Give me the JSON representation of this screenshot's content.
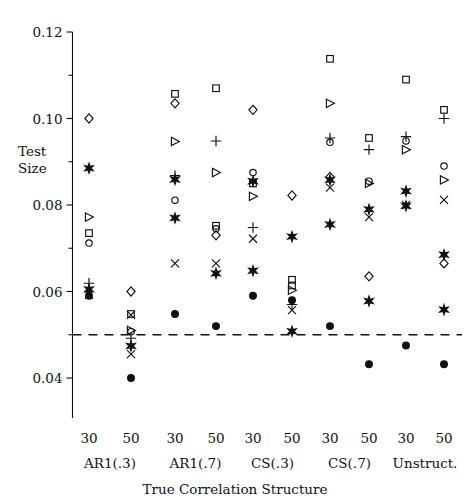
{
  "chart_data": {
    "type": "scatter",
    "title": "",
    "xlabel": "True Correlation Structure",
    "ylabel": "Test Size",
    "ylabel_line1": "Test",
    "ylabel_line2": "Size",
    "ylim": [
      0.028,
      0.12
    ],
    "yticks": [
      0.04,
      0.06,
      0.08,
      0.1,
      0.12
    ],
    "ytick_labels": [
      "0.04",
      "0.06",
      "0.08",
      "0.10",
      "0.12"
    ],
    "yminor_ticks": [
      0.05,
      0.07,
      0.09,
      0.11
    ],
    "grid": false,
    "legend": "none",
    "reference_line": {
      "y": 0.05,
      "style": "dashed",
      "label": "nominal 0.05 level"
    },
    "x_tick_labels": [
      "30",
      "50",
      "30",
      "50",
      "30",
      "50",
      "30",
      "50",
      "30",
      "50"
    ],
    "group_labels": [
      "AR1(.3)",
      "AR1(.7)",
      "CS(.3)",
      "CS(.7)",
      "Unstruct."
    ],
    "marker_types": [
      "circle",
      "square",
      "diamond",
      "triangle-right",
      "plus",
      "cross",
      "star",
      "filled-circle"
    ],
    "columns": [
      {
        "group": "AR1(.3)",
        "n": "30",
        "points": [
          {
            "marker": "diamond",
            "value": 0.1
          },
          {
            "marker": "star",
            "value": 0.0885
          },
          {
            "marker": "triangle-right",
            "value": 0.0772
          },
          {
            "marker": "square",
            "value": 0.0735
          },
          {
            "marker": "circle",
            "value": 0.0712
          },
          {
            "marker": "plus",
            "value": 0.0619
          },
          {
            "marker": "star",
            "value": 0.0605
          },
          {
            "marker": "cross",
            "value": 0.0592
          },
          {
            "marker": "filled-circle",
            "value": 0.059
          }
        ]
      },
      {
        "group": "AR1(.3)",
        "n": "50",
        "points": [
          {
            "marker": "diamond",
            "value": 0.06
          },
          {
            "marker": "square",
            "value": 0.0548
          },
          {
            "marker": "cross",
            "value": 0.0546
          },
          {
            "marker": "triangle-right",
            "value": 0.051
          },
          {
            "marker": "circle",
            "value": 0.0507
          },
          {
            "marker": "plus",
            "value": 0.0492
          },
          {
            "marker": "star",
            "value": 0.0474
          },
          {
            "marker": "cross",
            "value": 0.0455
          },
          {
            "marker": "filled-circle",
            "value": 0.04
          }
        ]
      },
      {
        "group": "AR1(.7)",
        "n": "30",
        "points": [
          {
            "marker": "square",
            "value": 0.1057
          },
          {
            "marker": "diamond",
            "value": 0.1035
          },
          {
            "marker": "triangle-right",
            "value": 0.0947
          },
          {
            "marker": "plus",
            "value": 0.0868
          },
          {
            "marker": "star",
            "value": 0.0859
          },
          {
            "marker": "circle",
            "value": 0.0811
          },
          {
            "marker": "star",
            "value": 0.077
          },
          {
            "marker": "cross",
            "value": 0.0665
          },
          {
            "marker": "filled-circle",
            "value": 0.0548
          }
        ]
      },
      {
        "group": "AR1(.7)",
        "n": "50",
        "points": [
          {
            "marker": "square",
            "value": 0.107
          },
          {
            "marker": "plus",
            "value": 0.0948
          },
          {
            "marker": "triangle-right",
            "value": 0.0875
          },
          {
            "marker": "square",
            "value": 0.0752
          },
          {
            "marker": "circle",
            "value": 0.0745
          },
          {
            "marker": "diamond",
            "value": 0.073
          },
          {
            "marker": "cross",
            "value": 0.0665
          },
          {
            "marker": "star",
            "value": 0.0642
          },
          {
            "marker": "filled-circle",
            "value": 0.052
          }
        ]
      },
      {
        "group": "CS(.3)",
        "n": "30",
        "points": [
          {
            "marker": "diamond",
            "value": 0.102
          },
          {
            "marker": "circle",
            "value": 0.0875
          },
          {
            "marker": "star",
            "value": 0.0855
          },
          {
            "marker": "square",
            "value": 0.085
          },
          {
            "marker": "triangle-right",
            "value": 0.082
          },
          {
            "marker": "plus",
            "value": 0.0748
          },
          {
            "marker": "cross",
            "value": 0.0722
          },
          {
            "marker": "star",
            "value": 0.0648
          },
          {
            "marker": "filled-circle",
            "value": 0.059
          }
        ]
      },
      {
        "group": "CS(.3)",
        "n": "50",
        "points": [
          {
            "marker": "diamond",
            "value": 0.0822
          },
          {
            "marker": "star",
            "value": 0.0727
          },
          {
            "marker": "square",
            "value": 0.0627
          },
          {
            "marker": "square",
            "value": 0.0614
          },
          {
            "marker": "triangle-right",
            "value": 0.0603
          },
          {
            "marker": "filled-circle",
            "value": 0.058
          },
          {
            "marker": "plus",
            "value": 0.057
          },
          {
            "marker": "cross",
            "value": 0.0557
          },
          {
            "marker": "star",
            "value": 0.0508
          }
        ]
      },
      {
        "group": "CS(.7)",
        "n": "30",
        "points": [
          {
            "marker": "square",
            "value": 0.1138
          },
          {
            "marker": "triangle-right",
            "value": 0.1035
          },
          {
            "marker": "plus",
            "value": 0.0955
          },
          {
            "marker": "circle",
            "value": 0.0945
          },
          {
            "marker": "diamond",
            "value": 0.0865
          },
          {
            "marker": "star",
            "value": 0.0858
          },
          {
            "marker": "cross",
            "value": 0.084
          },
          {
            "marker": "star",
            "value": 0.0755
          },
          {
            "marker": "filled-circle",
            "value": 0.052
          }
        ]
      },
      {
        "group": "CS(.7)",
        "n": "50",
        "points": [
          {
            "marker": "square",
            "value": 0.0955
          },
          {
            "marker": "plus",
            "value": 0.0928
          },
          {
            "marker": "circle",
            "value": 0.0855
          },
          {
            "marker": "triangle-right",
            "value": 0.085
          },
          {
            "marker": "star",
            "value": 0.079
          },
          {
            "marker": "cross",
            "value": 0.0772
          },
          {
            "marker": "diamond",
            "value": 0.0635
          },
          {
            "marker": "star",
            "value": 0.0578
          },
          {
            "marker": "filled-circle",
            "value": 0.0432
          }
        ]
      },
      {
        "group": "Unstruct.",
        "n": "30",
        "points": [
          {
            "marker": "square",
            "value": 0.109
          },
          {
            "marker": "plus",
            "value": 0.0958
          },
          {
            "marker": "circle",
            "value": 0.0948
          },
          {
            "marker": "triangle-right",
            "value": 0.0928
          },
          {
            "marker": "star",
            "value": 0.0832
          },
          {
            "marker": "cross",
            "value": 0.08
          },
          {
            "marker": "star",
            "value": 0.0798
          },
          {
            "marker": "filled-circle",
            "value": 0.0475
          }
        ]
      },
      {
        "group": "Unstruct.",
        "n": "50",
        "points": [
          {
            "marker": "square",
            "value": 0.102
          },
          {
            "marker": "plus",
            "value": 0.1
          },
          {
            "marker": "circle",
            "value": 0.089
          },
          {
            "marker": "triangle-right",
            "value": 0.0858
          },
          {
            "marker": "cross",
            "value": 0.0812
          },
          {
            "marker": "star",
            "value": 0.0685
          },
          {
            "marker": "diamond",
            "value": 0.0665
          },
          {
            "marker": "star",
            "value": 0.0558
          },
          {
            "marker": "filled-circle",
            "value": 0.0432
          }
        ]
      }
    ]
  },
  "axes": {
    "y_label_line1": "Test",
    "y_label_line2": "Size",
    "x_title": "True Correlation Structure"
  }
}
